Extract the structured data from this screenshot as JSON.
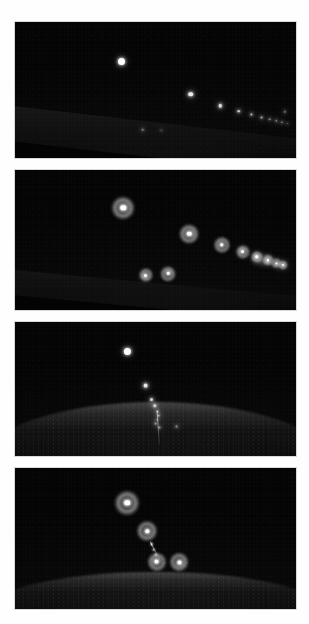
{
  "figure": {
    "name": "night-sky-light-sequence-figure",
    "background_color": "#fefefe",
    "panel_count": 4,
    "page_width": 309,
    "page_height": 624,
    "caption_fragment": ""
  },
  "panels": [
    {
      "id": "panel-1",
      "label": "panel-1-raw-diagonal-sequence",
      "kind": "raw",
      "x": 15,
      "y": 22,
      "w": 281,
      "h": 136,
      "terrain": {
        "type": "diagonal-lit-slope",
        "description": "bright diagonal ridge lit from the left, descending left-to-right",
        "top_left_pct": 60,
        "top_right_pct": 88,
        "thickness_pct": 26
      },
      "lights": [
        {
          "name": "light-1",
          "x_pct": 38.0,
          "y_pct": 29.0,
          "size": 7.0,
          "brightness": 1.0
        },
        {
          "name": "light-2",
          "x_pct": 62.6,
          "y_pct": 53.0,
          "size": 4.6,
          "brightness": 0.92
        },
        {
          "name": "light-3",
          "x_pct": 73.0,
          "y_pct": 61.5,
          "size": 3.4,
          "brightness": 0.85
        },
        {
          "name": "light-4",
          "x_pct": 79.6,
          "y_pct": 65.5,
          "size": 2.6,
          "brightness": 0.78
        },
        {
          "name": "light-5",
          "x_pct": 84.2,
          "y_pct": 68.0,
          "size": 2.2,
          "brightness": 0.7
        },
        {
          "name": "light-6",
          "x_pct": 87.8,
          "y_pct": 70.0,
          "size": 1.9,
          "brightness": 0.64
        },
        {
          "name": "light-7",
          "x_pct": 90.6,
          "y_pct": 71.4,
          "size": 1.7,
          "brightness": 0.58
        },
        {
          "name": "light-8",
          "x_pct": 93.0,
          "y_pct": 72.6,
          "size": 1.5,
          "brightness": 0.52
        },
        {
          "name": "light-9",
          "x_pct": 95.0,
          "y_pct": 73.6,
          "size": 1.3,
          "brightness": 0.46
        },
        {
          "name": "light-10",
          "x_pct": 96.8,
          "y_pct": 74.4,
          "size": 1.2,
          "brightness": 0.4
        },
        {
          "name": "ground-light-a",
          "x_pct": 45.5,
          "y_pct": 79.0,
          "size": 1.6,
          "brightness": 0.42
        },
        {
          "name": "ground-light-b",
          "x_pct": 52.0,
          "y_pct": 79.5,
          "size": 1.6,
          "brightness": 0.4
        },
        {
          "name": "ground-light-c",
          "x_pct": 96.0,
          "y_pct": 66.0,
          "size": 1.4,
          "brightness": 0.38
        }
      ],
      "streaks": []
    },
    {
      "id": "panel-2",
      "label": "panel-2-processed-halo-diagonal-sequence",
      "kind": "halo",
      "x": 15,
      "y": 170,
      "w": 281,
      "h": 140,
      "terrain": {
        "type": "diagonal-lit-slope",
        "description": "faint diagonal ridge line descending left-to-right",
        "top_left_pct": 70,
        "top_right_pct": 92,
        "thickness_pct": 18
      },
      "lights": [
        {
          "name": "halo-1",
          "x_pct": 38.5,
          "y_pct": 27.0,
          "ring": 26,
          "core": 5.4
        },
        {
          "name": "halo-2",
          "x_pct": 62.0,
          "y_pct": 45.5,
          "ring": 22,
          "core": 4.4
        },
        {
          "name": "halo-3",
          "x_pct": 73.5,
          "y_pct": 53.5,
          "ring": 18,
          "core": 3.6
        },
        {
          "name": "halo-4",
          "x_pct": 81.0,
          "y_pct": 58.5,
          "ring": 15,
          "core": 3.0
        },
        {
          "name": "halo-5",
          "x_pct": 86.0,
          "y_pct": 62.0,
          "ring": 13,
          "core": 2.6
        },
        {
          "name": "halo-6",
          "x_pct": 90.0,
          "y_pct": 64.5,
          "ring": 12,
          "core": 2.3
        },
        {
          "name": "halo-7",
          "x_pct": 93.0,
          "y_pct": 66.5,
          "ring": 11,
          "core": 2.1
        },
        {
          "name": "halo-8",
          "x_pct": 95.5,
          "y_pct": 68.0,
          "ring": 10,
          "core": 1.9
        },
        {
          "name": "halo-ground-a",
          "x_pct": 46.5,
          "y_pct": 75.0,
          "ring": 15,
          "core": 3.0
        },
        {
          "name": "halo-ground-b",
          "x_pct": 54.5,
          "y_pct": 74.0,
          "ring": 17,
          "core": 3.4
        }
      ],
      "glow_blobs": [
        {
          "name": "merged-glow-right",
          "x_pct": 88.0,
          "y_pct": 64.0,
          "w": 26,
          "h": 16
        }
      ],
      "streaks": []
    },
    {
      "id": "panel-3",
      "label": "panel-3-raw-vertical-descent",
      "kind": "raw",
      "x": 15,
      "y": 322,
      "w": 281,
      "h": 134,
      "terrain": {
        "type": "convex-hill",
        "description": "broad convex hill crest with textured lit ground",
        "crest_pct": 60,
        "height_pct": 46
      },
      "lights": [
        {
          "name": "light-1",
          "x_pct": 40.0,
          "y_pct": 22.0,
          "size": 7.2,
          "brightness": 1.0
        },
        {
          "name": "light-2",
          "x_pct": 46.5,
          "y_pct": 47.5,
          "size": 3.8,
          "brightness": 0.9
        },
        {
          "name": "light-3",
          "x_pct": 48.5,
          "y_pct": 57.5,
          "size": 3.0,
          "brightness": 0.82
        },
        {
          "name": "light-4",
          "x_pct": 49.8,
          "y_pct": 62.5,
          "size": 2.4,
          "brightness": 0.74
        },
        {
          "name": "light-5",
          "x_pct": 50.6,
          "y_pct": 66.5,
          "size": 2.0,
          "brightness": 0.66
        },
        {
          "name": "light-6",
          "x_pct": 51.0,
          "y_pct": 69.8,
          "size": 1.8,
          "brightness": 0.58
        },
        {
          "name": "light-7",
          "x_pct": 50.6,
          "y_pct": 73.0,
          "size": 1.7,
          "brightness": 0.52
        },
        {
          "name": "light-8",
          "x_pct": 50.0,
          "y_pct": 76.0,
          "size": 1.8,
          "brightness": 0.5
        },
        {
          "name": "light-9",
          "x_pct": 51.5,
          "y_pct": 78.5,
          "size": 2.2,
          "brightness": 0.56
        },
        {
          "name": "light-10",
          "x_pct": 57.5,
          "y_pct": 78.0,
          "size": 2.0,
          "brightness": 0.5
        }
      ],
      "streaks": [
        {
          "name": "descent-trail",
          "x_pct": 50.5,
          "y_pct": 66.0,
          "len_pct": 12,
          "angle": 86,
          "thick": 1.1
        }
      ]
    },
    {
      "id": "panel-4",
      "label": "panel-4-processed-halo-vertical-descent",
      "kind": "halo",
      "x": 15,
      "y": 468,
      "w": 281,
      "h": 141,
      "terrain": {
        "type": "convex-hill",
        "description": "low dark convex mound along the bottom",
        "crest_pct": 74,
        "height_pct": 30
      },
      "lights": [
        {
          "name": "halo-1",
          "x_pct": 40.0,
          "y_pct": 24.5,
          "ring": 28,
          "core": 5.6
        },
        {
          "name": "halo-2",
          "x_pct": 47.0,
          "y_pct": 45.0,
          "ring": 23,
          "core": 4.4
        },
        {
          "name": "halo-3",
          "x_pct": 50.5,
          "y_pct": 66.5,
          "ring": 21,
          "core": 4.0
        },
        {
          "name": "halo-4",
          "x_pct": 58.5,
          "y_pct": 67.0,
          "ring": 21,
          "core": 4.0
        }
      ],
      "glow_blobs": [],
      "streaks": [
        {
          "name": "link-trail",
          "x_pct": 48.0,
          "y_pct": 52.0,
          "len_pct": 9,
          "angle": 62,
          "thick": 1.3
        }
      ],
      "inner_dots": [
        {
          "name": "inner-dot-1",
          "x_pct": 48.6,
          "y_pct": 54.0,
          "size": 1.6
        },
        {
          "name": "inner-dot-2",
          "x_pct": 49.4,
          "y_pct": 58.0,
          "size": 1.5
        },
        {
          "name": "inner-dot-3",
          "x_pct": 50.2,
          "y_pct": 61.5,
          "size": 1.4
        }
      ]
    }
  ]
}
